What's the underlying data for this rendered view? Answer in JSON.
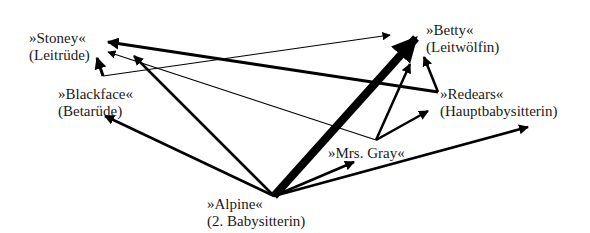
{
  "diagram": {
    "type": "directed-graph",
    "nodes": [
      {
        "id": "stoney",
        "name": "»Stoney«",
        "role": "(Leitrüde)",
        "x": 29,
        "y": 30
      },
      {
        "id": "betty",
        "name": "»Betty«",
        "role": "(Leitwölfin)",
        "x": 426,
        "y": 26
      },
      {
        "id": "blackface",
        "name": "»Blackface«",
        "role": "(Betarüde)",
        "x": 58,
        "y": 87
      },
      {
        "id": "redears",
        "name": "»Redears«",
        "role": "(Hauptbabysitterin)",
        "x": 440,
        "y": 87
      },
      {
        "id": "mrsgray",
        "name": "»Mrs. Gray«",
        "role": "",
        "x": 328,
        "y": 146
      },
      {
        "id": "alpine",
        "name": "»Alpine«",
        "role": "(2. Babysitterin)",
        "x": 207,
        "y": 196
      }
    ],
    "edges": [
      {
        "from": "redears",
        "to": "stoney",
        "weight": 3
      },
      {
        "from": "blackface",
        "to": "stoney",
        "weight": 3
      },
      {
        "from": "blackface",
        "to": "betty",
        "weight": 1
      },
      {
        "from": "mrsgray",
        "to": "stoney",
        "weight": 1
      },
      {
        "from": "alpine",
        "to": "stoney",
        "weight": 2.5
      },
      {
        "from": "alpine",
        "to": "blackface",
        "weight": 2.5
      },
      {
        "from": "alpine",
        "to": "betty",
        "weight": 8
      },
      {
        "from": "alpine",
        "to": "mrsgray",
        "weight": 2.5
      },
      {
        "from": "alpine",
        "to": "offscreen-right",
        "weight": 2.5
      },
      {
        "from": "mrsgray",
        "to": "betty",
        "weight": 2.5
      },
      {
        "from": "mrsgray",
        "to": "redears",
        "weight": 2.5
      },
      {
        "from": "redears",
        "to": "betty",
        "weight": 2.5
      }
    ],
    "colors": {
      "line": "#000000",
      "text": "#1a1a1a",
      "background": "#ffffff"
    }
  }
}
